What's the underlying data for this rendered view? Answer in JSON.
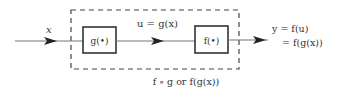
{
  "diagram": {
    "type": "block-diagram",
    "input": {
      "label": "x"
    },
    "blocks": [
      {
        "id": "g",
        "label": "g(•)"
      },
      {
        "id": "f",
        "label": "f(•)"
      }
    ],
    "intermediate": {
      "label": "u = g(x)"
    },
    "output": {
      "line1": "y = f(u)",
      "line2": "= f(g(x))"
    },
    "composite": {
      "label": "f ∘ g or f(g(x))"
    },
    "colors": {
      "stroke": "#333333",
      "line": "#777777",
      "dash": "#444444",
      "text": "#333333",
      "background": "#ffffff"
    }
  }
}
